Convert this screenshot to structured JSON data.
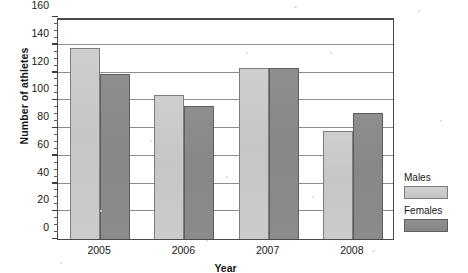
{
  "chart_data": {
    "type": "bar",
    "title": "",
    "xlabel": "Year",
    "ylabel": "Number of athletes",
    "categories": [
      "2005",
      "2006",
      "2007",
      "2008"
    ],
    "series": [
      {
        "name": "Males",
        "values": [
          138,
          104,
          123,
          78
        ],
        "color": "#c9c9c9"
      },
      {
        "name": "Females",
        "values": [
          119,
          96,
          123,
          91
        ],
        "color": "#8a8a8a"
      }
    ],
    "ylim": [
      0,
      160
    ],
    "ytick_step": 20,
    "yminor_step": 5,
    "ytick_labels": [
      "0",
      "20",
      "40",
      "60",
      "80",
      "100",
      "120",
      "140",
      "160"
    ],
    "grid": true,
    "grid_axis": "y",
    "legend_position": "right"
  },
  "legend": {
    "entries": [
      {
        "label": "Males",
        "swatch": "light-gray-swatch"
      },
      {
        "label": "Females",
        "swatch": "dark-gray-swatch"
      }
    ]
  }
}
